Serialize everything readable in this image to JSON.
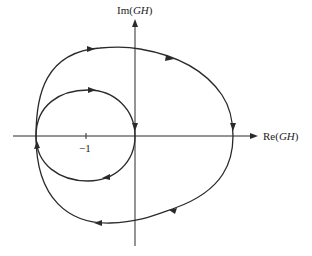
{
  "diagram": {
    "type": "nyquist-plot",
    "axes": {
      "x_label": "Re(GH)",
      "y_label": "Im(GH)",
      "x_label_prefix": "Re(",
      "x_label_var": "GH",
      "x_label_suffix": ")",
      "y_label_prefix": "Im(",
      "y_label_var": "GH",
      "y_label_suffix": ")",
      "tick_labels": [
        {
          "value": -1,
          "text": "−1"
        }
      ]
    },
    "curves": [
      {
        "name": "outer-contour",
        "direction": "clockwise",
        "arrows": 5
      },
      {
        "name": "inner-loop",
        "direction": "clockwise",
        "arrows": 3
      }
    ],
    "colors": {
      "stroke": "#2a2a2a",
      "background": "#ffffff"
    }
  }
}
